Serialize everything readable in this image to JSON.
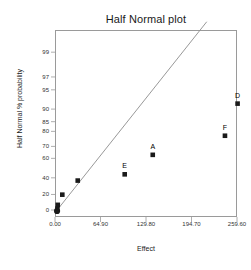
{
  "chart_data": {
    "type": "scatter",
    "title": "Half Normal plot",
    "xlabel": "Effect",
    "ylabel": "Half Normal % probability",
    "grid": false,
    "legend": "none",
    "xlim": [
      0.0,
      259.6
    ],
    "ylim": [
      0,
      99
    ],
    "xticks": [
      0.0,
      64.9,
      129.8,
      194.7,
      259.6
    ],
    "xtick_labels": [
      "0.00",
      "64.90",
      "129.80",
      "194.70",
      "259.60"
    ],
    "yticks": [
      0,
      20,
      40,
      60,
      70,
      80,
      85,
      90,
      95,
      97,
      99
    ],
    "ytick_labels": [
      "0",
      "20",
      "40",
      "60",
      "70",
      "80",
      "85",
      "90",
      "95",
      "97",
      "99"
    ],
    "y_scale": "half-normal probability",
    "points": [
      {
        "label": "",
        "x": 1.5,
        "y": 0.0,
        "marker": "circle"
      },
      {
        "label": "",
        "x": 2.0,
        "y": 3.0,
        "marker": "square"
      },
      {
        "label": "",
        "x": 2.5,
        "y": 8.0,
        "marker": "square"
      },
      {
        "label": "",
        "x": 9.0,
        "y": 21.0,
        "marker": "square"
      },
      {
        "label": "",
        "x": 31.0,
        "y": 38.0,
        "marker": "square"
      },
      {
        "label": "E",
        "x": 98.0,
        "y": 45.0,
        "marker": "square"
      },
      {
        "label": "A",
        "x": 138.0,
        "y": 64.0,
        "marker": "square"
      },
      {
        "label": "F",
        "x": 241.0,
        "y": 78.0,
        "marker": "square"
      },
      {
        "label": "D",
        "x": 259.0,
        "y": 92.0,
        "marker": "square"
      }
    ],
    "reference_line": {
      "name": "half-normal reference line",
      "x_start": 1.0,
      "y_start": 0.5,
      "x_end": 215.0,
      "y_end": 99.8
    },
    "colors": {
      "marker": "#1a1a1a",
      "line": "#8c8c8c",
      "frame": "#9a9a9a",
      "text": "#1a1a1a",
      "tick_text": "#333333"
    }
  }
}
